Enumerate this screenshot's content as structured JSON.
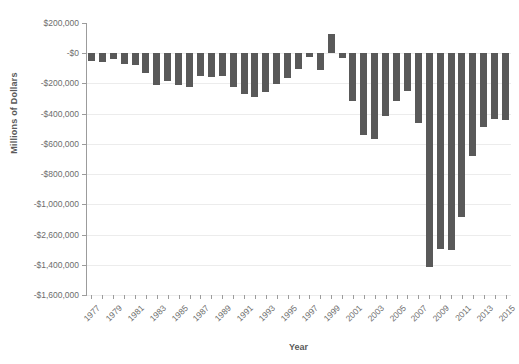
{
  "chart_data": {
    "type": "bar",
    "title": "",
    "xlabel": "Year",
    "ylabel": "Millions of Dollars",
    "grid": true,
    "legend": false,
    "ylim": [
      -1600000,
      200000
    ],
    "ytick_labels": [
      "$200,000",
      "-$0",
      "-$200,000",
      "-$400,000",
      "-$600,000",
      "-$800,000",
      "-$1,000,000",
      "-$2,600,000",
      "-$1,400,000",
      "-$1,600,000"
    ],
    "ytick_values": [
      200000,
      0,
      -200000,
      -400000,
      -600000,
      -800000,
      -1000000,
      -1200000,
      -1400000,
      -1600000
    ],
    "xtick_labels": [
      "1977",
      "1979",
      "1981",
      "1983",
      "1985",
      "1987",
      "1989",
      "1991",
      "1993",
      "1995",
      "1997",
      "1999",
      "2001",
      "2003",
      "2005",
      "2007",
      "2009",
      "2011",
      "2013",
      "2015"
    ],
    "categories": [
      "1977",
      "1978",
      "1979",
      "1980",
      "1981",
      "1982",
      "1983",
      "1984",
      "1985",
      "1986",
      "1987",
      "1988",
      "1989",
      "1990",
      "1991",
      "1992",
      "1993",
      "1994",
      "1995",
      "1996",
      "1997",
      "1998",
      "1999",
      "2000",
      "2001",
      "2002",
      "2003",
      "2004",
      "2005",
      "2006",
      "2007",
      "2008",
      "2009",
      "2010",
      "2011",
      "2012",
      "2013",
      "2014",
      "2015"
    ],
    "values": [
      -53600,
      -59200,
      -40700,
      -73800,
      -79000,
      -128000,
      -207800,
      -185400,
      -212300,
      -221200,
      -149700,
      -155200,
      -152600,
      -221200,
      -269200,
      -290300,
      -255100,
      -203200,
      -164000,
      -107400,
      -21900,
      -109000,
      128200,
      -32400,
      -317400,
      -538400,
      -568100,
      -412700,
      -318300,
      -248200,
      -458500,
      -1415700,
      -1294400,
      -1299500,
      -1087000,
      -679800,
      -485000,
      -438000,
      -440000
    ],
    "bar_color": "#595959"
  }
}
